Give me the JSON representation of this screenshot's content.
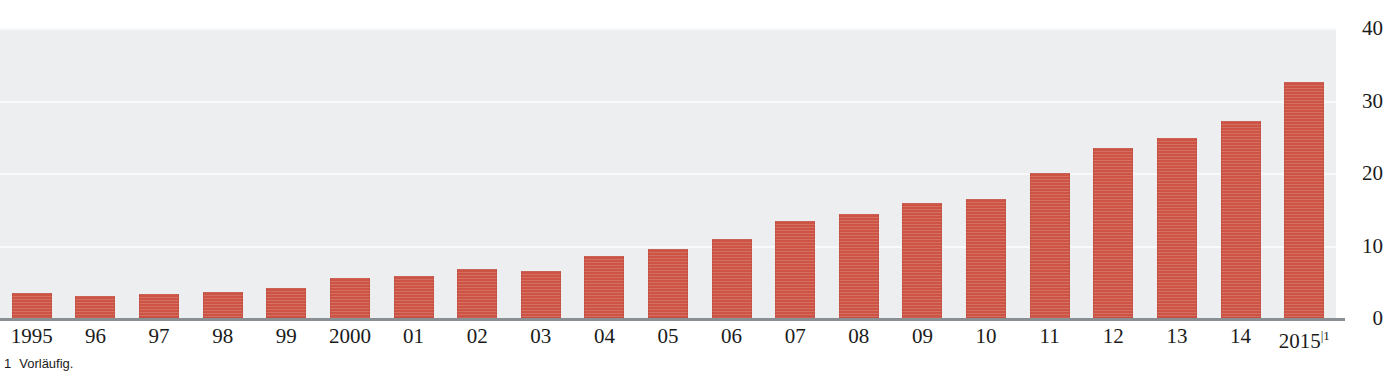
{
  "figure": {
    "top_clipped_text": "",
    "footnote_marker": "1",
    "footnote_text": "Vorläufig.",
    "bar_color": "#cd5344",
    "plot_background": "#eceef0",
    "gridline_color": "#f8f9fa",
    "axis_color": "#8a8f94"
  },
  "chart_data": {
    "type": "bar",
    "title": "",
    "subtitle": "",
    "xlabel": "",
    "ylabel": "",
    "ylim": [
      0,
      40
    ],
    "yticks": [
      0,
      10,
      20,
      30,
      40
    ],
    "ytick_labels": [
      "0",
      "10",
      "20",
      "30",
      "40"
    ],
    "grid": true,
    "grid_axis": "y",
    "legend": false,
    "legend_position": "none",
    "y_axis_position": "right",
    "categories": [
      "1995",
      "96",
      "97",
      "98",
      "99",
      "2000",
      "01",
      "02",
      "03",
      "04",
      "05",
      "06",
      "07",
      "08",
      "09",
      "10",
      "11",
      "12",
      "13",
      "14",
      "2015"
    ],
    "category_labels": [
      "1995",
      "96",
      "97",
      "98",
      "99",
      "2000",
      "01",
      "02",
      "03",
      "04",
      "05",
      "06",
      "07",
      "08",
      "09",
      "10",
      "11",
      "12",
      "13",
      "14",
      "2015"
    ],
    "category_footnotes": [
      "",
      "",
      "",
      "",
      "",
      "",
      "",
      "",
      "",
      "",
      "",
      "",
      "",
      "",
      "",
      "",
      "",
      "",
      "",
      "",
      "1"
    ],
    "values": [
      3.4,
      3.0,
      3.3,
      3.6,
      4.2,
      5.5,
      5.8,
      6.7,
      6.5,
      8.5,
      9.5,
      10.9,
      13.4,
      14.4,
      15.8,
      16.4,
      20.0,
      23.4,
      24.8,
      27.2,
      32.5
    ],
    "annotations": []
  }
}
